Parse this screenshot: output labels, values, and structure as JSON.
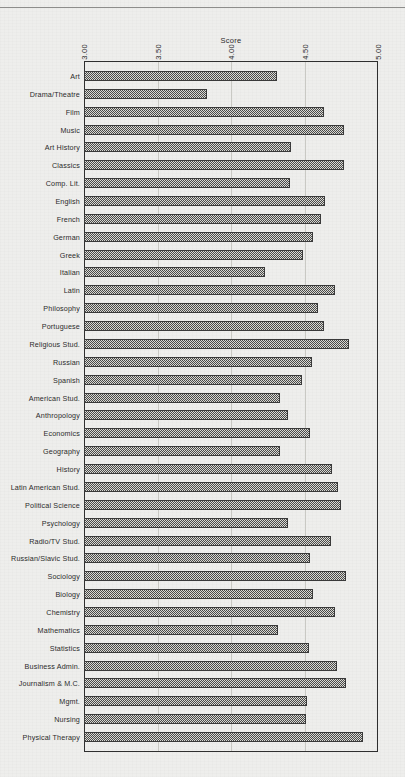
{
  "chart_data": {
    "type": "bar",
    "orientation": "horizontal",
    "title": "",
    "xlabel": "Score",
    "ylabel": "",
    "xlim": [
      3.0,
      5.0
    ],
    "xticks": [
      "3.00",
      "3.50",
      "4.00",
      "4.50",
      "5.00"
    ],
    "xtick_values": [
      3.0,
      3.5,
      4.0,
      4.5,
      5.0
    ],
    "grid": true,
    "grid_axis": "x",
    "legend": null,
    "categories": [
      "Art",
      "Drama/Theatre",
      "Film",
      "Music",
      "Art History",
      "Classics",
      "Comp. Lit.",
      "English",
      "French",
      "German",
      "Greek",
      "Italian",
      "Latin",
      "Philosophy",
      "Portuguese",
      "Religious Stud.",
      "Russian",
      "Spanish",
      "American Stud.",
      "Anthropology",
      "Economics",
      "Geography",
      "History",
      "Latin American Stud.",
      "Political Science",
      "Psychology",
      "Radio/TV Stud.",
      "Russian/Slavic Stud.",
      "Sociology",
      "Biology",
      "Chemistry",
      "Mathematics",
      "Statistics",
      "Business Admin.",
      "Journalism & M.C.",
      "Mgmt.",
      "Nursing",
      "Physical Therapy"
    ],
    "values": [
      4.31,
      3.84,
      4.63,
      4.77,
      4.41,
      4.77,
      4.4,
      4.64,
      4.61,
      4.56,
      4.49,
      4.23,
      4.71,
      4.59,
      4.63,
      4.8,
      4.55,
      4.48,
      4.33,
      4.39,
      4.54,
      4.33,
      4.69,
      4.73,
      4.75,
      4.39,
      4.68,
      4.54,
      4.78,
      4.56,
      4.71,
      4.32,
      4.53,
      4.72,
      4.78,
      4.52,
      4.51,
      4.9
    ]
  },
  "axis": {
    "title": "Score",
    "ticks": [
      "3.00",
      "3.50",
      "4.00",
      "4.50",
      "5.00"
    ]
  }
}
